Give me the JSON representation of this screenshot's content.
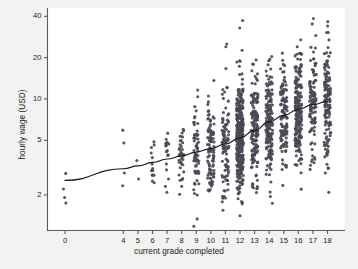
{
  "chart_data": {
    "type": "scatter",
    "title": "",
    "xlabel": "current grade completed",
    "ylabel": "hourly wage (USD)",
    "yscale": "log",
    "xlim": [
      -1.2,
      19.2
    ],
    "ylim": [
      1.1,
      46
    ],
    "grid": false,
    "legend": null,
    "marker_color": "#4a4a55",
    "line_color": "#1a1a1a",
    "background_color": "#f2f2f0",
    "plot_background_color": "#ffffff",
    "xticks": [
      0,
      4,
      5,
      6,
      7,
      8,
      9,
      10,
      11,
      12,
      13,
      14,
      15,
      16,
      17,
      18
    ],
    "xticklabels": [
      "0",
      "4",
      "5",
      "6",
      "7",
      "8",
      "9",
      "10",
      "11",
      "12",
      "13",
      "14",
      "15",
      "16",
      "17",
      "18"
    ],
    "yticks": [
      2,
      5,
      10,
      20,
      40
    ],
    "yticklabels": [
      "2",
      "5",
      "10",
      "20",
      "40"
    ],
    "series": [
      {
        "name": "observations",
        "kind": "scatter",
        "note": "jittered hourly wage by grade completed; counts grow sharply at grades 12 and above",
        "counts_by_grade": {
          "0": 4,
          "4": 4,
          "5": 2,
          "6": 14,
          "7": 18,
          "8": 34,
          "9": 64,
          "10": 92,
          "11": 104,
          "12": 340,
          "13": 150,
          "14": 168,
          "15": 120,
          "16": 210,
          "17": 110,
          "18": 150
        }
      },
      {
        "name": "lowess fit",
        "kind": "line",
        "x": [
          0,
          4,
          5,
          6,
          7,
          8,
          9,
          10,
          11,
          12,
          13,
          14,
          15,
          16,
          17,
          18
        ],
        "y": [
          2.55,
          3.1,
          3.25,
          3.45,
          3.65,
          3.85,
          4.1,
          4.35,
          4.7,
          5.2,
          5.9,
          6.8,
          7.6,
          8.4,
          9.1,
          9.6
        ]
      }
    ]
  },
  "figure": {
    "xlabel": "current grade completed",
    "ylabel": "hourly wage (USD)"
  }
}
